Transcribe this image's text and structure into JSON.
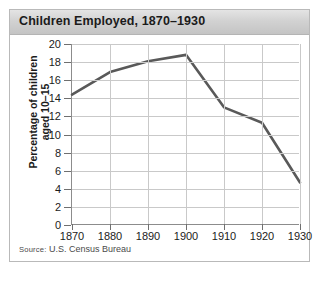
{
  "figure": {
    "title": "Children Employed, 1870–1930",
    "source_prefix": "Source:",
    "source_text": " U.S. Census Bureau",
    "frame_color": "#b9b9b9",
    "title_band_color": "#d2d2d2",
    "line_color": "#595959",
    "grid_color": "#c9c9c9"
  },
  "chart_data": {
    "type": "line",
    "title": "Children Employed, 1870–1930",
    "xlabel": "",
    "ylabel": "Percentage of children aged 10–15",
    "ylabel_line1": "Percentage of children",
    "ylabel_line2": "aged 10–15",
    "x": [
      1870,
      1880,
      1890,
      1900,
      1910,
      1920,
      1930
    ],
    "values": [
      14.4,
      16.9,
      18.1,
      18.8,
      13.0,
      11.3,
      4.7
    ],
    "xtick_labels": [
      "1870",
      "1880",
      "1890",
      "1900",
      "1910",
      "1920",
      "1930"
    ],
    "ytick_labels": [
      "0",
      "2",
      "4",
      "6",
      "8",
      "10",
      "12",
      "14",
      "16",
      "18",
      "20"
    ],
    "yticks": [
      0,
      2,
      4,
      6,
      8,
      10,
      12,
      14,
      16,
      18,
      20
    ],
    "xlim": [
      1870,
      1930
    ],
    "ylim": [
      0,
      20
    ],
    "grid": true,
    "legend": "none",
    "series_name": "Percentage of children aged 10-15 employed"
  }
}
